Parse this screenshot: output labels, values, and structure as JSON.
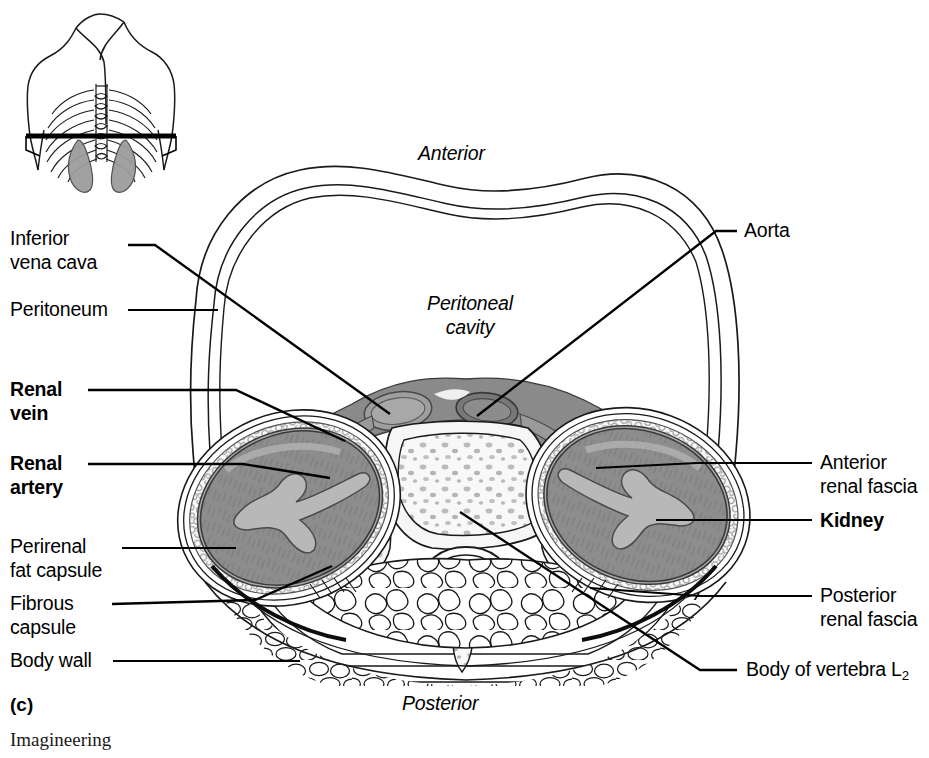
{
  "figure": {
    "panel_letter": "(c)",
    "credit": "Imagineering",
    "orientation_top": "Anterior",
    "orientation_bottom": "Posterior",
    "cavity_label": "Peritoneal\ncavity"
  },
  "labels_left": [
    {
      "id": "inferior-vena-cava",
      "text": "Inferior\nvena cava",
      "bold": false
    },
    {
      "id": "peritoneum",
      "text": "Peritoneum",
      "bold": false
    },
    {
      "id": "renal-vein",
      "text": "Renal\nvein",
      "bold": true
    },
    {
      "id": "renal-artery",
      "text": "Renal\nartery",
      "bold": true
    },
    {
      "id": "perirenal-fat-capsule",
      "text": "Perirenal\nfat capsule",
      "bold": false
    },
    {
      "id": "fibrous-capsule",
      "text": "Fibrous\ncapsule",
      "bold": false
    },
    {
      "id": "body-wall",
      "text": "Body wall",
      "bold": false
    }
  ],
  "labels_right": [
    {
      "id": "aorta",
      "text": "Aorta",
      "bold": false
    },
    {
      "id": "anterior-renal-fascia",
      "text": "Anterior\nrenal fascia",
      "bold": false
    },
    {
      "id": "kidney",
      "text": "Kidney",
      "bold": true
    },
    {
      "id": "posterior-renal-fascia",
      "text": "Posterior\nrenal fascia",
      "bold": false
    },
    {
      "id": "body-of-vertebra",
      "text": "Body of vertebra L",
      "subscript": "2",
      "bold": false
    }
  ],
  "colors": {
    "outline": "#1a1a1a",
    "kidney_cortex": "#8d8d8d",
    "kidney_hilum": "#b6b6b6",
    "vessel_band": "#8a8a8a",
    "vessel_lumen": "#9a9a9a",
    "fat_light": "#f2f2f2",
    "bone_marrow": "#f7f7f7",
    "marrow_fleck": "#b9b9b9",
    "inset_organ": "#9c9c9c",
    "background": "#ffffff"
  },
  "inset": {
    "id": "torso-orientation-inset",
    "description": "Posterior torso outline with ribcage, vertebral column, kidneys and horizontal sectioning plane"
  },
  "anatomy_parts": [
    "body-wall-outer-contour",
    "peritoneum-membrane",
    "peritoneal-cavity",
    "inferior-vena-cava",
    "aorta",
    "renal-vein",
    "renal-artery",
    "left-kidney",
    "right-kidney",
    "perirenal-fat-capsule",
    "fibrous-capsule",
    "anterior-renal-fascia",
    "posterior-renal-fascia",
    "vertebral-body-L2",
    "spinal-cord",
    "paravertebral-muscle",
    "subcutaneous-fat"
  ]
}
